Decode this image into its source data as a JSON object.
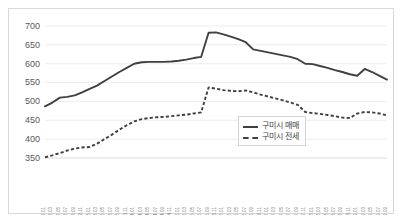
{
  "chart_data": {
    "type": "line",
    "title": "",
    "xlabel": "",
    "ylabel": "",
    "ylim": [
      350,
      700
    ],
    "ytick_labels": [
      "700",
      "650",
      "600",
      "550",
      "500",
      "450",
      "400",
      "350"
    ],
    "yticks": [
      700,
      650,
      600,
      550,
      500,
      450,
      400,
      350
    ],
    "grid": true,
    "legend_position": "center-right",
    "categories": [
      "2012.01",
      "2012.03",
      "2012.05",
      "2012.07",
      "2012.09",
      "2012.11",
      "2013.01",
      "2013.03",
      "2013.05",
      "2013.07",
      "2013.09",
      "2013.11",
      "2014.01",
      "2014.03",
      "2014.05",
      "2014.07",
      "2014.09",
      "2014.11",
      "2015.01",
      "2015.03",
      "2015.05",
      "2015.07",
      "2015.09",
      "2015.11",
      "2016.01",
      "2016.03",
      "2016.05",
      "2016.07",
      "2016.09",
      "2016.11",
      "2017.01",
      "2017.03",
      "2017.05",
      "2017.07",
      "2017.09",
      "2017.11",
      "2018.01",
      "2018.03",
      "2018.05",
      "2018.07",
      "2018.09",
      "2018.11",
      "2019.01",
      "2019.03",
      "2019.05",
      "2019.07",
      "2019.09"
    ],
    "series": [
      {
        "name": "구미시 매매",
        "style": "solid",
        "color": "#404040",
        "values": [
          487,
          497,
          510,
          512,
          516,
          524,
          533,
          542,
          554,
          566,
          578,
          589,
          600,
          604,
          605,
          605,
          605,
          606,
          608,
          611,
          615,
          618,
          682,
          683,
          678,
          672,
          665,
          657,
          638,
          634,
          630,
          626,
          622,
          618,
          612,
          600,
          599,
          594,
          589,
          583,
          578,
          572,
          568,
          586,
          578,
          568,
          558
        ]
      },
      {
        "name": "구미시 전세",
        "style": "dashed",
        "color": "#404040",
        "values": [
          352,
          357,
          363,
          370,
          375,
          378,
          379,
          388,
          400,
          412,
          425,
          437,
          447,
          453,
          456,
          458,
          459,
          461,
          463,
          465,
          468,
          471,
          537,
          534,
          530,
          528,
          527,
          529,
          524,
          518,
          513,
          508,
          503,
          497,
          491,
          472,
          469,
          467,
          464,
          461,
          457,
          456,
          468,
          472,
          471,
          468,
          463
        ]
      }
    ]
  },
  "legend": {
    "items": [
      {
        "label": "구미시 매매",
        "style": "solid"
      },
      {
        "label": "구미시 전세",
        "style": "dashed"
      }
    ]
  }
}
